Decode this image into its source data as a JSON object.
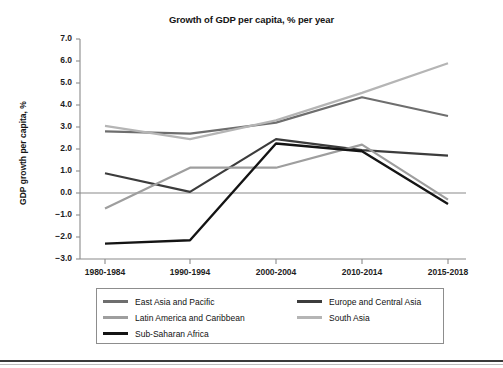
{
  "chart_data": {
    "type": "line",
    "title": "Growth of GDP per capita, % per year",
    "xlabel": "",
    "ylabel": "GDP growth per capita, %",
    "categories": [
      "1980-1984",
      "1990-1994",
      "2000-2004",
      "2010-2014",
      "2015-2018"
    ],
    "ylim": [
      -3.0,
      7.0
    ],
    "yticks": [
      "7.0",
      "6.0",
      "5.0",
      "4.0",
      "3.0",
      "2.0",
      "1.0",
      "0.0",
      "-1.0",
      "-2.0",
      "-3.0"
    ],
    "ytick_values": [
      7.0,
      6.0,
      5.0,
      4.0,
      3.0,
      2.0,
      1.0,
      0.0,
      -1.0,
      -2.0,
      -3.0
    ],
    "grid": false,
    "zero_line": true,
    "legend_position": "bottom",
    "series": [
      {
        "name": "East Asia and Pacific",
        "color": "#6e6e6e",
        "width": 2.2,
        "values": [
          2.8,
          2.7,
          3.2,
          4.35,
          3.5
        ]
      },
      {
        "name": "Europe and Central Asia",
        "color": "#3c3c3c",
        "width": 2.2,
        "values": [
          0.9,
          0.05,
          2.45,
          1.95,
          1.7
        ]
      },
      {
        "name": "Latin America and Caribbean",
        "color": "#9e9e9e",
        "width": 2.2,
        "values": [
          -0.7,
          1.15,
          1.15,
          2.2,
          -0.3
        ]
      },
      {
        "name": "South Asia",
        "color": "#b5b5b5",
        "width": 2.2,
        "values": [
          3.05,
          2.45,
          3.3,
          4.55,
          5.9
        ]
      },
      {
        "name": "Sub-Saharan Africa",
        "color": "#141414",
        "width": 2.4,
        "values": [
          -2.3,
          -2.15,
          2.25,
          1.9,
          -0.5
        ]
      }
    ]
  },
  "legend": {
    "items": [
      {
        "label": "East Asia and Pacific",
        "color": "#6e6e6e",
        "col": 0,
        "row": 0
      },
      {
        "label": "Europe and Central Asia",
        "color": "#3c3c3c",
        "col": 1,
        "row": 0
      },
      {
        "label": "Latin America and Caribbean",
        "color": "#9e9e9e",
        "col": 0,
        "row": 1
      },
      {
        "label": "South Asia",
        "color": "#b5b5b5",
        "col": 1,
        "row": 1
      },
      {
        "label": "Sub-Saharan Africa",
        "color": "#141414",
        "col": 0,
        "row": 2
      }
    ]
  },
  "axes": {
    "axis_color": "#8a8a8a",
    "zero_line_color": "#8a8a8a"
  }
}
